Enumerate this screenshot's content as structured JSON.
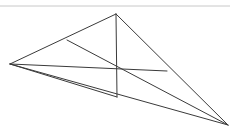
{
  "figure": {
    "type": "line-diagram",
    "canvas": {
      "width": 230,
      "height": 127,
      "background": "#ffffff"
    },
    "style": {
      "stroke": "#3a3a3a",
      "stroke_width": 1,
      "rule_stroke": "#c8c8c8",
      "rule_stroke_width": 1
    },
    "top_rule": {
      "label": "top horizontal rule",
      "x1": 0,
      "y1": 6,
      "x2": 230,
      "y2": 6
    },
    "vertices": [
      {
        "id": "L",
        "label": "left apex",
        "x": 10,
        "y": 64
      },
      {
        "id": "T",
        "label": "top apex",
        "x": 116,
        "y": 14
      },
      {
        "id": "R",
        "label": "bottom right apex",
        "x": 228,
        "y": 125
      },
      {
        "id": "A",
        "label": "upper left edge node",
        "x": 67,
        "y": 40
      },
      {
        "id": "C",
        "label": "center intersection",
        "x": 117,
        "y": 70
      },
      {
        "id": "E",
        "label": "right edge node",
        "x": 167,
        "y": 71
      },
      {
        "id": "B",
        "label": "base node",
        "x": 117,
        "y": 97
      }
    ],
    "edges": [
      {
        "id": "e1",
        "label": "left apex to top apex",
        "x1": 10,
        "y1": 64,
        "x2": 116,
        "y2": 14
      },
      {
        "id": "e2",
        "label": "top apex to bottom right",
        "x1": 116,
        "y1": 14,
        "x2": 228,
        "y2": 125
      },
      {
        "id": "e3",
        "label": "left apex to bottom right",
        "x1": 10,
        "y1": 64,
        "x2": 228,
        "y2": 125
      },
      {
        "id": "e4",
        "label": "left apex to right edge node",
        "x1": 10,
        "y1": 64,
        "x2": 167,
        "y2": 71
      },
      {
        "id": "e5",
        "label": "upper node to bottom right",
        "x1": 67,
        "y1": 40,
        "x2": 228,
        "y2": 125
      },
      {
        "id": "e6",
        "label": "left apex to base node",
        "x1": 10,
        "y1": 64,
        "x2": 117,
        "y2": 97
      },
      {
        "id": "e7",
        "label": "top apex to base node",
        "x1": 116,
        "y1": 14,
        "x2": 117,
        "y2": 97
      }
    ]
  }
}
